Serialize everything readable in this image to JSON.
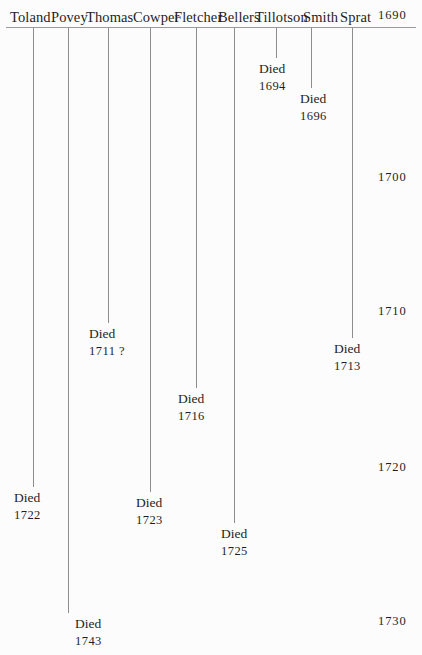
{
  "figure": {
    "type": "timeline",
    "background_color": "#fcfcfc",
    "line_color": "#8d8d8d",
    "text_color": "#1f1f1f",
    "year_axis": {
      "orientation": "vertical",
      "direction": "top-to-bottom increasing",
      "position": "right",
      "range": [
        1690,
        1735
      ],
      "tick_labels": [
        "1690",
        "1700",
        "1710",
        "1720",
        "1730"
      ],
      "tick_years": [
        1690,
        1700,
        1710,
        1720,
        1730
      ],
      "tick_y_px": [
        14,
        176,
        310,
        466,
        620
      ]
    },
    "died_label": "Died",
    "uncertain_marker": "?"
  },
  "chart_data": {
    "type": "timeline",
    "title": "",
    "xlabel": "",
    "ylabel": "",
    "ylim": [
      1690,
      1735
    ],
    "categories": [
      "Toland",
      "Povey",
      "Thomas",
      "Cowper",
      "Fletcher",
      "Bellers",
      "Tillotson",
      "Smith",
      "Sprat"
    ],
    "values": [
      1722,
      1743,
      1711,
      1723,
      1716,
      1725,
      1694,
      1696,
      1713
    ],
    "series": [
      {
        "name": "death year",
        "values": [
          1722,
          1743,
          1711,
          1723,
          1716,
          1725,
          1694,
          1696,
          1713
        ]
      }
    ],
    "people": [
      {
        "name": "Toland",
        "name_x": 10,
        "line_x": 33,
        "line_top": 28,
        "line_bottom": 487,
        "death_label": "Died",
        "death_year": "1722",
        "uncertain": "",
        "label_x": 14,
        "label_y": 487
      },
      {
        "name": "Povey",
        "name_x": 51,
        "line_x": 68,
        "line_top": 28,
        "line_bottom": 613,
        "death_label": "Died",
        "death_year": "1743",
        "uncertain": "",
        "label_x": 75,
        "label_y": 613
      },
      {
        "name": "Thomas",
        "name_x": 86,
        "line_x": 108,
        "line_top": 28,
        "line_bottom": 323,
        "death_label": "Died",
        "death_year": "1711",
        "uncertain": "?",
        "label_x": 89,
        "label_y": 323
      },
      {
        "name": "Cowper",
        "name_x": 133,
        "line_x": 150,
        "line_top": 28,
        "line_bottom": 492,
        "death_label": "Died",
        "death_year": "1723",
        "uncertain": "",
        "label_x": 136,
        "label_y": 492
      },
      {
        "name": "Fletcher",
        "name_x": 174,
        "line_x": 196,
        "line_top": 28,
        "line_bottom": 388,
        "death_label": "Died",
        "death_year": "1716",
        "uncertain": "",
        "label_x": 178,
        "label_y": 388
      },
      {
        "name": "Bellers",
        "name_x": 218,
        "line_x": 234,
        "line_top": 28,
        "line_bottom": 523,
        "death_label": "Died",
        "death_year": "1725",
        "uncertain": "",
        "label_x": 221,
        "label_y": 523
      },
      {
        "name": "Tillotson",
        "name_x": 255,
        "line_x": 276,
        "line_top": 28,
        "line_bottom": 58,
        "death_label": "Died",
        "death_year": "1694",
        "uncertain": "",
        "label_x": 259,
        "label_y": 58
      },
      {
        "name": "Smith",
        "name_x": 303,
        "line_x": 311,
        "line_top": 28,
        "line_bottom": 88,
        "death_label": "Died",
        "death_year": "1696",
        "uncertain": "",
        "label_x": 300,
        "label_y": 88
      },
      {
        "name": "Sprat",
        "name_x": 340,
        "line_x": 352,
        "line_top": 28,
        "line_bottom": 338,
        "death_label": "Died",
        "death_year": "1713",
        "uncertain": "",
        "label_x": 334,
        "label_y": 338
      }
    ],
    "decades": [
      {
        "label": "1690",
        "x": 378,
        "y": 8
      },
      {
        "label": "1700",
        "x": 378,
        "y": 170
      },
      {
        "label": "1710",
        "x": 378,
        "y": 304
      },
      {
        "label": "1720",
        "x": 378,
        "y": 460
      },
      {
        "label": "1730",
        "x": 378,
        "y": 614
      }
    ]
  }
}
